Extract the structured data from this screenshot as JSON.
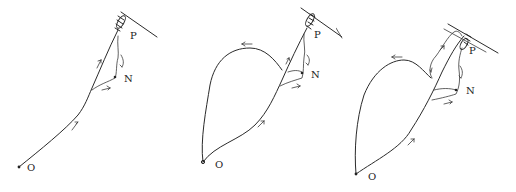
{
  "diagram": {
    "type": "path-sequence",
    "colors": {
      "ink": "#2a2a2a",
      "background": "#ffffff"
    },
    "panels": [
      {
        "id": "panel-1",
        "labels": {
          "origin": "O",
          "target": "P",
          "branch": "N"
        },
        "description": "Straight path from O up to P at wall, small branch toward N"
      },
      {
        "id": "panel-2",
        "labels": {
          "origin": "O",
          "target": "P",
          "branch": "N"
        },
        "description": "Loop from O bulging left, returning to main path near P and N"
      },
      {
        "id": "panel-3",
        "labels": {
          "origin": "O",
          "target": "P",
          "branch": "N"
        },
        "description": "Larger loop with additional detour arc near P along wall"
      }
    ]
  }
}
